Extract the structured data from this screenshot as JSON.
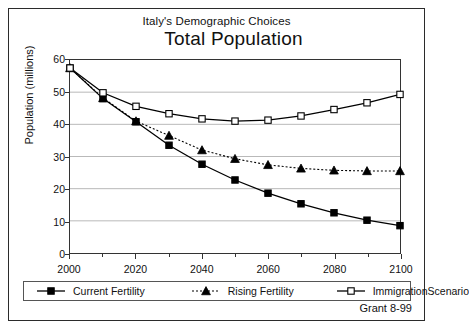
{
  "figure": {
    "subtitle": "Italy's Demographic Choices",
    "title": "Total Population",
    "footer": "Grant 8-99"
  },
  "chart_data": {
    "type": "line",
    "title": "Total Population",
    "subtitle": "Italy's Demographic Choices",
    "xlabel": "",
    "ylabel": "Population (millions)",
    "xlim": [
      2000,
      2100
    ],
    "ylim": [
      0,
      60
    ],
    "xticks": [
      2000,
      2010,
      2020,
      2030,
      2040,
      2050,
      2060,
      2070,
      2080,
      2090,
      2100
    ],
    "xtick_labels": [
      "2000",
      "",
      "2020",
      "",
      "2040",
      "",
      "2060",
      "",
      "2080",
      "",
      "2100"
    ],
    "yticks": [
      0,
      10,
      20,
      30,
      40,
      50,
      60
    ],
    "ytick_labels": [
      "0",
      "10",
      "20",
      "30",
      "40",
      "50",
      "60"
    ],
    "grid": true,
    "legend_position": "bottom",
    "x": [
      2000,
      2010,
      2020,
      2030,
      2040,
      2050,
      2060,
      2070,
      2080,
      2090,
      2100
    ],
    "series": [
      {
        "name": "Current Fertility",
        "marker": "filled-square",
        "line": "solid",
        "color": "#000000",
        "values": [
          57.5,
          48.0,
          40.8,
          33.5,
          27.6,
          22.7,
          18.6,
          15.3,
          12.5,
          10.2,
          8.5
        ]
      },
      {
        "name": "Rising Fertility",
        "marker": "filled-triangle",
        "line": "dashed",
        "color": "#000000",
        "values": [
          57.5,
          48.2,
          41.0,
          36.5,
          32.0,
          29.3,
          27.4,
          26.3,
          25.7,
          25.5,
          25.5
        ]
      },
      {
        "name": "ImmigrationScenario",
        "marker": "open-square",
        "line": "solid",
        "color": "#000000",
        "values": [
          57.5,
          49.8,
          45.6,
          43.3,
          41.7,
          41.0,
          41.3,
          42.6,
          44.6,
          46.7,
          49.3
        ]
      }
    ]
  },
  "legend": {
    "items": [
      {
        "label": "Current Fertility",
        "marker": "filled-square-icon"
      },
      {
        "label": "Rising Fertility",
        "marker": "filled-triangle-icon"
      },
      {
        "label": "ImmigrationScenario",
        "marker": "open-square-icon"
      }
    ]
  }
}
